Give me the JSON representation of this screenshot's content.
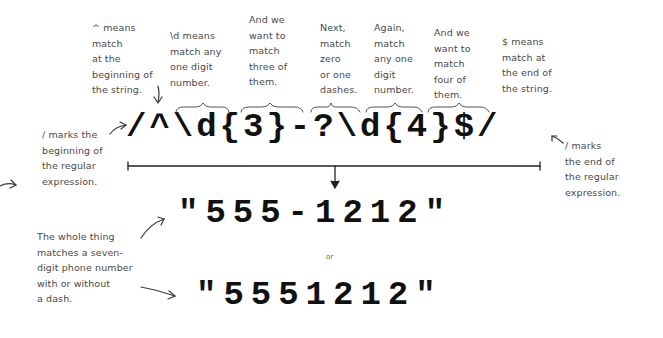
{
  "regex": {
    "pattern": "/^\\d{3}-?\\d{4}$/",
    "parts": [
      "/",
      "^",
      "\\d",
      "{3}",
      "-?",
      "\\d",
      "{4}",
      "$",
      "/"
    ]
  },
  "annotations": {
    "caret": "^ means\nmatch\nat the\nbeginning of\nthe string.",
    "digit1": "\\d means\nmatch any\none digit\nnumber.",
    "three": "And we\nwant to\nmatch\nthree of\nthem.",
    "dash": "Next,\nmatch\nzero\nor one\ndashes.",
    "digit2": "Again,\nmatch\nany one\ndigit\nnumber.",
    "four": "And we\nwant to\nmatch\nfour of\nthem.",
    "dollar": "$ means\nmatch at\nthe end of\nthe string.",
    "slash_begin": "/ marks the\nbeginning of\nthe regular\nexpression.",
    "slash_end": "/ marks\nthe end of\nthe regular\nexpression.",
    "whole": "The whole thing\nmatches a seven-\ndigit phone number\nwith or without\na dash."
  },
  "matches": {
    "first": "\"555-1212\"",
    "separator": "or",
    "second": "\"5551212\""
  },
  "icons": [
    "arrow-down-icon",
    "curved-arrow-icon",
    "brace-icon",
    "bracket-line-icon"
  ]
}
